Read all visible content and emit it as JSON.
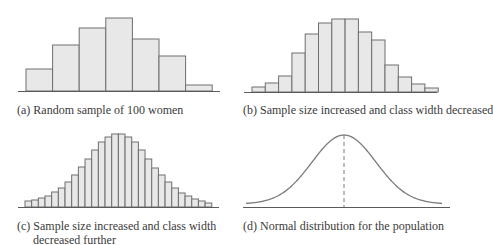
{
  "colors": {
    "bar_fill": "#e8e8e8",
    "bar_stroke": "#6e6e6e",
    "axis": "#5a5a5a",
    "curve": "#7a7a7a",
    "text": "#3a3a3a",
    "background": "#ffffff"
  },
  "captions": {
    "a": "(a) Random sample of 100 women",
    "b": "(b) Sample size increased and class width decreased",
    "c_line1": "(c) Sample size increased and class width",
    "c_line2": "decreased further",
    "d": "(d) Normal distribution for the population"
  },
  "chart_data": [
    {
      "id": "a",
      "type": "bar",
      "title": "(a) Random sample of 100 women",
      "xlabel": "",
      "ylabel": "",
      "grid": false,
      "categories": [
        "1",
        "2",
        "3",
        "4",
        "5",
        "6",
        "7"
      ],
      "values": [
        22,
        46,
        63,
        73,
        52,
        35,
        6
      ],
      "layout": {
        "baseline_y": 91,
        "x0": 26,
        "bar_width": 26.6,
        "axis_x": [
          18,
          220
        ]
      }
    },
    {
      "id": "b",
      "type": "bar",
      "title": "(b) Sample size increased and class width decreased",
      "xlabel": "",
      "ylabel": "",
      "grid": false,
      "categories": [
        "1",
        "2",
        "3",
        "4",
        "5",
        "6",
        "7",
        "8",
        "9",
        "10",
        "11",
        "12",
        "13",
        "14"
      ],
      "values": [
        5,
        9,
        16,
        39,
        58,
        69,
        73,
        73,
        60,
        52,
        27,
        15,
        8,
        4
      ],
      "layout": {
        "baseline_y": 92,
        "x0": 252,
        "bar_width": 13.3,
        "axis_x": [
          244,
          437
        ]
      }
    },
    {
      "id": "c",
      "type": "bar",
      "title": "(c) Sample size increased and class width decreased further",
      "xlabel": "",
      "ylabel": "",
      "grid": false,
      "categories": [
        "1",
        "2",
        "3",
        "4",
        "5",
        "6",
        "7",
        "8",
        "9",
        "10",
        "11",
        "12",
        "13",
        "14",
        "15",
        "16",
        "17",
        "18",
        "19",
        "20",
        "21",
        "22",
        "23",
        "24",
        "25",
        "26",
        "27",
        "28"
      ],
      "values": [
        6,
        7,
        9,
        11,
        15,
        19,
        25,
        32,
        40,
        48,
        57,
        65,
        70,
        73,
        73,
        70,
        65,
        57,
        48,
        39,
        32,
        25,
        19,
        14,
        11,
        8,
        6,
        4
      ],
      "layout": {
        "baseline_y": 207,
        "x0": 25,
        "bar_width": 6.67,
        "axis_x": [
          18,
          219
        ]
      }
    },
    {
      "id": "d",
      "type": "line",
      "title": "(d) Normal distribution for the population",
      "xlabel": "",
      "ylabel": "",
      "grid": false,
      "distribution": "normal",
      "peak_marker": "dashed vertical line at mean",
      "layout": {
        "baseline_y": 207,
        "axis_x": [
          243,
          450
        ],
        "mean_x": 344,
        "peak_height": 72,
        "sigma_px": 32,
        "curve_x": [
          246,
          442
        ]
      }
    }
  ]
}
